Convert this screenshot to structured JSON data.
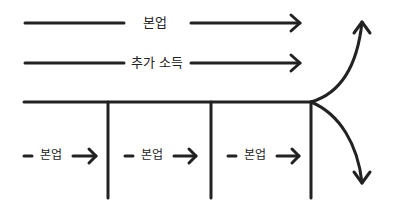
{
  "diagram": {
    "type": "flow-diagram",
    "stroke_color": "#222222",
    "background": "#ffffff",
    "top_flows": [
      {
        "label": "본업"
      },
      {
        "label": "추가 소득"
      }
    ],
    "segment_flows": [
      {
        "label": "본업"
      },
      {
        "label": "본업"
      },
      {
        "label": "본업"
      }
    ],
    "branches": [
      {
        "direction": "up"
      },
      {
        "direction": "down"
      }
    ]
  }
}
